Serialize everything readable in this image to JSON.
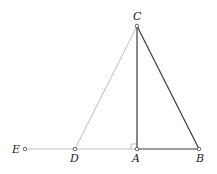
{
  "diagram": {
    "title": "",
    "points": {
      "A": {
        "label": "A",
        "x": 137,
        "y": 149
      },
      "B": {
        "label": "B",
        "x": 199,
        "y": 149
      },
      "C": {
        "label": "C",
        "x": 137,
        "y": 26
      },
      "D": {
        "label": "D",
        "x": 75,
        "y": 149
      },
      "E": {
        "label": "E",
        "x": 25,
        "y": 149
      }
    },
    "segments": [
      {
        "from": "C",
        "to": "A",
        "style": "solid-dark"
      },
      {
        "from": "C",
        "to": "B",
        "style": "solid-dark"
      },
      {
        "from": "A",
        "to": "B",
        "style": "solid-dark"
      },
      {
        "from": "C",
        "to": "D",
        "style": "light"
      },
      {
        "from": "E",
        "to": "A",
        "style": "light"
      }
    ],
    "right_angle_at": "A",
    "colors": {
      "dark": "#3a3a3a",
      "light": "#b8b8b8"
    }
  }
}
